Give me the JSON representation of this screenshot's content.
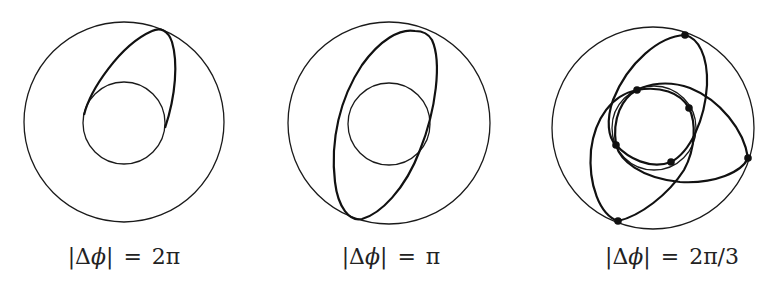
{
  "figure": {
    "panels": [
      {
        "id": "panel-2pi",
        "label": {
          "bar_open": "|",
          "delta": "Δ",
          "phi": "ϕ",
          "bar_close": "|",
          "equals": "=",
          "value": "2π"
        },
        "outer_circle": {
          "cx": 124,
          "cy": 122,
          "r": 100
        },
        "inner_circle": {
          "cx": 124,
          "cy": 123,
          "r": 41
        },
        "loops": 1,
        "dots": 0
      },
      {
        "id": "panel-pi",
        "label": {
          "bar_open": "|",
          "delta": "Δ",
          "phi": "ϕ",
          "bar_close": "|",
          "equals": "=",
          "value": "π"
        },
        "outer_circle": {
          "cx": 389,
          "cy": 123,
          "r": 101
        },
        "inner_circle": {
          "cx": 389,
          "cy": 123,
          "r": 41
        },
        "loops": 1,
        "dots": 0
      },
      {
        "id": "panel-2pi-3",
        "label": {
          "bar_open": "|",
          "delta": "Δ",
          "phi": "ϕ",
          "bar_close": "|",
          "equals": "=",
          "value": "2π/3"
        },
        "outer_circle": {
          "cx": 653,
          "cy": 128,
          "r": 101
        },
        "inner_circle": {
          "cx": 654,
          "cy": 128,
          "r": 42
        },
        "loops": 3,
        "dots": 7
      }
    ],
    "colors": {
      "stroke": "#111111",
      "background": "#ffffff"
    }
  }
}
